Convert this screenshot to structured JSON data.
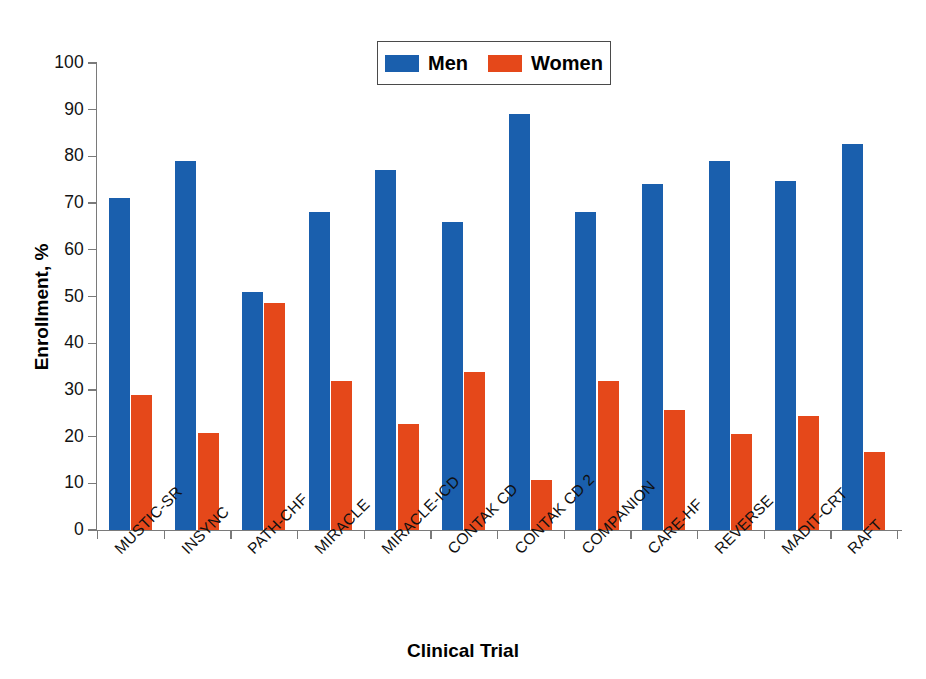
{
  "chart_data": {
    "type": "bar",
    "title": "",
    "xlabel": "Clinical Trial",
    "ylabel": "Enrollment, %",
    "ylim": [
      0,
      100
    ],
    "ytick_step": 10,
    "ytick_labels": [
      "0",
      "10",
      "20",
      "30",
      "40",
      "50",
      "60",
      "70",
      "80",
      "90",
      "100"
    ],
    "grid": false,
    "legend_position": "top-center",
    "categories": [
      "MUSTIC-SR",
      "INSYNC",
      "PATH-CHF",
      "MIRACLE",
      "MIRACLE-ICD",
      "CONTAK CD",
      "CONTAK CD 2",
      "COMPANION",
      "CARE-HF",
      "REVERSE",
      "MADIT-CRT",
      "RAFT"
    ],
    "series": [
      {
        "name": "Men",
        "color": "#1A5FAD",
        "values": [
          71.0,
          79.0,
          51.0,
          68.0,
          77.0,
          66.0,
          89.0,
          68.0,
          74.0,
          79.0,
          74.7,
          82.7
        ]
      },
      {
        "name": "Women",
        "color": "#E5481A",
        "values": [
          29.0,
          20.7,
          48.7,
          32.0,
          22.6,
          33.8,
          10.8,
          32.0,
          25.6,
          20.5,
          24.5,
          16.8
        ]
      }
    ]
  },
  "legend": {
    "items": [
      {
        "label": "Men",
        "color": "#1A5FAD"
      },
      {
        "label": "Women",
        "color": "#E5481A"
      }
    ]
  },
  "axes": {
    "y_title": "Enrollment, %",
    "x_title": "Clinical Trial"
  }
}
